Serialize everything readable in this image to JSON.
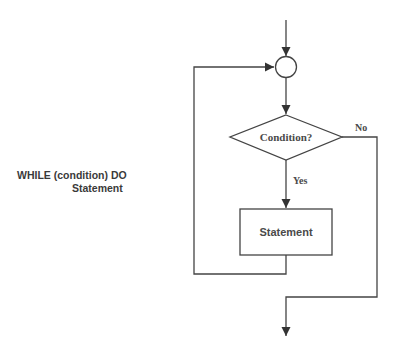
{
  "caption": {
    "line1": "WHILE (condition) DO",
    "line2": "Statement"
  },
  "flowchart": {
    "junction": {
      "shape": "circle"
    },
    "decision": {
      "label": "Condition?",
      "shape": "diamond"
    },
    "process": {
      "label": "Statement",
      "shape": "rectangle"
    },
    "edges": {
      "yes_label": "Yes",
      "no_label": "No"
    }
  },
  "colors": {
    "stroke": "#444444",
    "text": "#4a4a4a",
    "background": "#ffffff"
  }
}
